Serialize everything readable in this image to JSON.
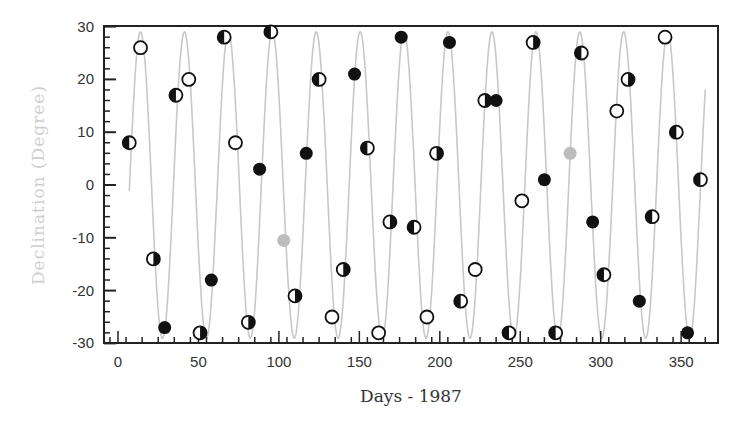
{
  "chart_data": {
    "type": "scatter",
    "title": "",
    "xlabel": "Days - 1987",
    "ylabel": "Declination (Degree)",
    "xlim": [
      -8,
      372
    ],
    "ylim": [
      -30,
      30
    ],
    "xticks": [
      0,
      50,
      100,
      150,
      200,
      250,
      300,
      350
    ],
    "yticks": [
      -30,
      -20,
      -10,
      0,
      10,
      20,
      30
    ],
    "grid": false,
    "legend": null,
    "colors": {
      "curve": "#c8c8c8",
      "frame": "#222222",
      "marker_dark": "#111111",
      "marker_gray": "#bdbdbd"
    },
    "curve": {
      "name": "Lunar declination",
      "shape": "sinusoid",
      "amplitude_deg": 29,
      "period_days": 27.3,
      "x_range": [
        7,
        365
      ],
      "phase_peak_day": 14
    },
    "series": [
      {
        "name": "Full moon (open circle)",
        "marker": "open",
        "points": [
          [
            14,
            26
          ],
          [
            44,
            20
          ],
          [
            73,
            8
          ],
          [
            133,
            -25
          ],
          [
            162,
            -28
          ],
          [
            192,
            -25
          ],
          [
            222,
            -16
          ],
          [
            251,
            -3
          ],
          [
            310,
            14
          ],
          [
            340,
            28
          ]
        ]
      },
      {
        "name": "New moon (filled circle)",
        "marker": "filled",
        "points": [
          [
            29,
            -27
          ],
          [
            58,
            -18
          ],
          [
            88,
            3
          ],
          [
            117,
            6
          ],
          [
            147,
            21
          ],
          [
            176,
            28
          ],
          [
            206,
            27
          ],
          [
            235,
            16
          ],
          [
            265,
            1
          ],
          [
            295,
            -7
          ],
          [
            324,
            -22
          ],
          [
            354,
            -28
          ]
        ]
      },
      {
        "name": "First quarter (left dark, right light)",
        "marker": "half-left",
        "points": [
          [
            7,
            8
          ],
          [
            36,
            17
          ],
          [
            66,
            28
          ],
          [
            95,
            29
          ],
          [
            125,
            20
          ],
          [
            155,
            7
          ],
          [
            184,
            -8
          ],
          [
            213,
            -22
          ],
          [
            243,
            -28
          ],
          [
            272,
            -28
          ],
          [
            302,
            -17
          ],
          [
            332,
            -6
          ],
          [
            362,
            1
          ],
          [
            347,
            10
          ],
          [
            288,
            25
          ]
        ]
      },
      {
        "name": "Last quarter (left light, right dark)",
        "marker": "half-right",
        "points": [
          [
            22,
            -14
          ],
          [
            51,
            -28
          ],
          [
            81,
            -26
          ],
          [
            110,
            -21
          ],
          [
            140,
            -16
          ],
          [
            169,
            -7
          ],
          [
            198,
            6
          ],
          [
            228,
            16
          ],
          [
            258,
            27
          ],
          [
            317,
            20
          ]
        ]
      },
      {
        "name": "Eclipse / special (gray)",
        "marker": "gray",
        "points": [
          [
            103,
            -10.5
          ],
          [
            281,
            6
          ]
        ]
      }
    ]
  }
}
